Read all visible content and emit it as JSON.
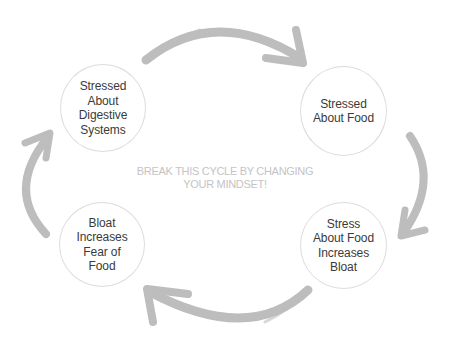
{
  "diagram": {
    "type": "cycle",
    "center_message": "BREAK THIS CYCLE BY CHANGING\nYOUR MINDSET!",
    "nodes": [
      {
        "id": "n1",
        "label": "Stressed\nAbout\nDigestive\nSystems",
        "position": "top-left"
      },
      {
        "id": "n2",
        "label": "Stressed\nAbout Food",
        "position": "top-right"
      },
      {
        "id": "n3",
        "label": "Stress\nAbout Food\nIncreases\nBloat",
        "position": "bottom-right"
      },
      {
        "id": "n4",
        "label": "Bloat\nIncreases\nFear of\nFood",
        "position": "bottom-left"
      }
    ],
    "edges": [
      {
        "from": "n1",
        "to": "n2",
        "icon": "curved-arrow-right"
      },
      {
        "from": "n2",
        "to": "n3",
        "icon": "curved-arrow-down"
      },
      {
        "from": "n3",
        "to": "n4",
        "icon": "curved-arrow-left"
      },
      {
        "from": "n4",
        "to": "n1",
        "icon": "curved-arrow-up"
      }
    ],
    "colors": {
      "arrow": "#bdbdbd",
      "node_border": "#dcdcdc",
      "node_text": "#3a3a3a",
      "center_text": "#c4c4c4"
    }
  }
}
